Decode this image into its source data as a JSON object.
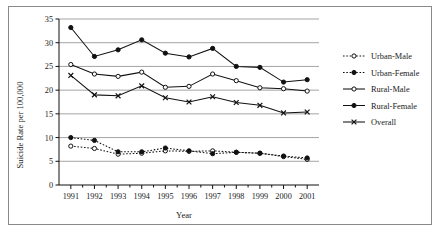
{
  "figure": {
    "border_color": "#8a8a8a",
    "background": "#ffffff"
  },
  "axes": {
    "y_title": "Suicide Rate per 100,000",
    "x_title": "Year",
    "y_ticks": [
      "0",
      "5",
      "10",
      "15",
      "20",
      "25",
      "30",
      "35"
    ],
    "x_ticks": [
      "1991",
      "1992",
      "1993",
      "1994",
      "1995",
      "1996",
      "1997",
      "1998",
      "1999",
      "2000",
      "2001"
    ]
  },
  "legend": {
    "position": "right",
    "entries": [
      {
        "label": "Urban-Male",
        "style": "dotted",
        "marker": "open-circle"
      },
      {
        "label": "Urban-Female",
        "style": "dotted",
        "marker": "filled-circle"
      },
      {
        "label": "Rural-Male",
        "style": "solid",
        "marker": "open-circle"
      },
      {
        "label": "Rural-Female",
        "style": "solid",
        "marker": "filled-circle"
      },
      {
        "label": "Overall",
        "style": "solid",
        "marker": "x"
      }
    ]
  },
  "chart_data": {
    "type": "line",
    "title": "",
    "xlabel": "Year",
    "ylabel": "Suicide Rate per 100,000",
    "x": [
      1991,
      1992,
      1993,
      1994,
      1995,
      1996,
      1997,
      1998,
      1999,
      2000,
      2001
    ],
    "categories": [
      "1991",
      "1992",
      "1993",
      "1994",
      "1995",
      "1996",
      "1997",
      "1998",
      "1999",
      "2000",
      "2001"
    ],
    "xlim": [
      1990.5,
      2001.5
    ],
    "ylim": [
      0,
      35
    ],
    "y_ticks": [
      0,
      5,
      10,
      15,
      20,
      25,
      30,
      35
    ],
    "grid": "horizontal",
    "legend_position": "right",
    "series": [
      {
        "name": "Urban-Male",
        "line_style": "dotted",
        "marker": "open-circle",
        "color": "#111111",
        "values": [
          8.2,
          7.7,
          6.5,
          6.7,
          7.2,
          7.1,
          7.2,
          6.9,
          6.7,
          6.0,
          5.4
        ]
      },
      {
        "name": "Urban-Female",
        "line_style": "dotted",
        "marker": "filled-circle",
        "color": "#111111",
        "values": [
          10.0,
          9.4,
          7.0,
          7.0,
          7.8,
          7.2,
          6.6,
          6.9,
          6.7,
          6.1,
          5.7
        ]
      },
      {
        "name": "Rural-Male",
        "line_style": "solid",
        "marker": "open-circle",
        "color": "#111111",
        "values": [
          25.4,
          23.4,
          22.9,
          23.8,
          20.6,
          20.8,
          23.4,
          22.0,
          20.5,
          20.3,
          19.8
        ]
      },
      {
        "name": "Rural-Female",
        "line_style": "solid",
        "marker": "filled-circle",
        "color": "#111111",
        "values": [
          33.2,
          27.1,
          28.5,
          30.6,
          27.8,
          27.0,
          28.8,
          25.0,
          24.8,
          21.7,
          22.2
        ]
      },
      {
        "name": "Overall",
        "line_style": "solid",
        "marker": "x",
        "color": "#111111",
        "values": [
          23.1,
          19.0,
          18.8,
          20.9,
          18.4,
          17.5,
          18.6,
          17.4,
          16.8,
          15.2,
          15.4
        ]
      }
    ]
  }
}
